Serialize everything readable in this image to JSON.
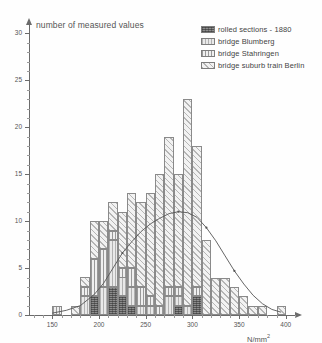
{
  "chart_data": {
    "type": "bar",
    "title": "number of measured values",
    "xlabel": "N/mm",
    "xlabel_sup": "2",
    "ylabel": "number of measured values",
    "xlim": [
      125,
      412
    ],
    "ylim": [
      0,
      31
    ],
    "grid": false,
    "legend_position": "top-right",
    "bin_width": 10,
    "categories": [
      150,
      160,
      170,
      180,
      190,
      200,
      210,
      220,
      230,
      240,
      250,
      260,
      270,
      280,
      290,
      300,
      310,
      320,
      330,
      340,
      350,
      360,
      370,
      380,
      390,
      400
    ],
    "series": [
      {
        "name": "rolled sections - 1880",
        "key": "rolled",
        "color": "#8d8d8d",
        "values": [
          0,
          0,
          0,
          0,
          2,
          0,
          3,
          2,
          1,
          0,
          0,
          0,
          0,
          1,
          0,
          2,
          0,
          0,
          0,
          0,
          0,
          0,
          0,
          0,
          0,
          0
        ]
      },
      {
        "name": "bridge Blumberg",
        "key": "blumberg",
        "color": "#e9e9e9",
        "values": [
          0,
          0,
          0,
          2,
          0,
          3,
          5,
          2,
          2,
          1,
          1,
          0,
          2,
          1,
          1,
          0,
          0,
          0,
          0,
          0,
          0,
          0,
          0,
          0,
          0,
          0
        ]
      },
      {
        "name": "bridge Stahringen",
        "key": "stahringen",
        "color": "#efefef",
        "values": [
          1,
          0,
          0,
          1,
          4,
          4,
          1,
          1,
          2,
          2,
          1,
          1,
          1,
          1,
          0,
          1,
          0,
          0,
          0,
          0,
          0,
          0,
          0,
          0,
          0,
          0
        ]
      },
      {
        "name": "bridge suburb train Berlin",
        "key": "berlin",
        "color": "#f2f2f2",
        "values": [
          0,
          0,
          1,
          1,
          4,
          3,
          3,
          6,
          8,
          9,
          11,
          14,
          16,
          12,
          22,
          15,
          8,
          4,
          4,
          3,
          2,
          1,
          1,
          0,
          1,
          0
        ]
      }
    ],
    "totals": [
      1,
      0,
      1,
      4,
      10,
      10,
      12,
      11,
      13,
      12,
      13,
      15,
      19,
      15,
      23,
      18,
      8,
      4,
      4,
      3,
      2,
      1,
      1,
      0,
      1,
      0
    ],
    "y_ticks": [
      0,
      5,
      10,
      15,
      20,
      25,
      30
    ],
    "x_ticks": [
      150,
      200,
      250,
      300,
      350,
      400
    ],
    "overlay_curve": {
      "name": "fitted normal distribution",
      "x": [
        150,
        165,
        180,
        195,
        205,
        215,
        225,
        235,
        245,
        255,
        265,
        275,
        285,
        295,
        305,
        315,
        325,
        335,
        345,
        355,
        365,
        375,
        385,
        395
      ],
      "y": [
        0.2,
        0.5,
        1.0,
        2.2,
        3.4,
        5.0,
        6.6,
        7.8,
        8.9,
        9.7,
        10.3,
        10.8,
        11.0,
        10.9,
        10.4,
        9.3,
        7.9,
        6.3,
        4.7,
        3.3,
        2.1,
        1.2,
        0.6,
        0.3
      ]
    }
  },
  "axis": {
    "y_tick_labels": [
      "0",
      "5",
      "10",
      "15",
      "20",
      "25",
      "30"
    ],
    "x_tick_labels": [
      "150",
      "200",
      "250",
      "300",
      "350",
      "400"
    ],
    "x_unit": "N/mm",
    "x_unit_sup": "2"
  },
  "legend": {
    "items": [
      {
        "label": "rolled sections - 1880",
        "swatch": "rolled"
      },
      {
        "label": "bridge Blumberg",
        "swatch": "blumberg"
      },
      {
        "label": "bridge Stahringen",
        "swatch": "stahringen"
      },
      {
        "label": "bridge suburb train Berlin",
        "swatch": "berlin"
      }
    ]
  }
}
